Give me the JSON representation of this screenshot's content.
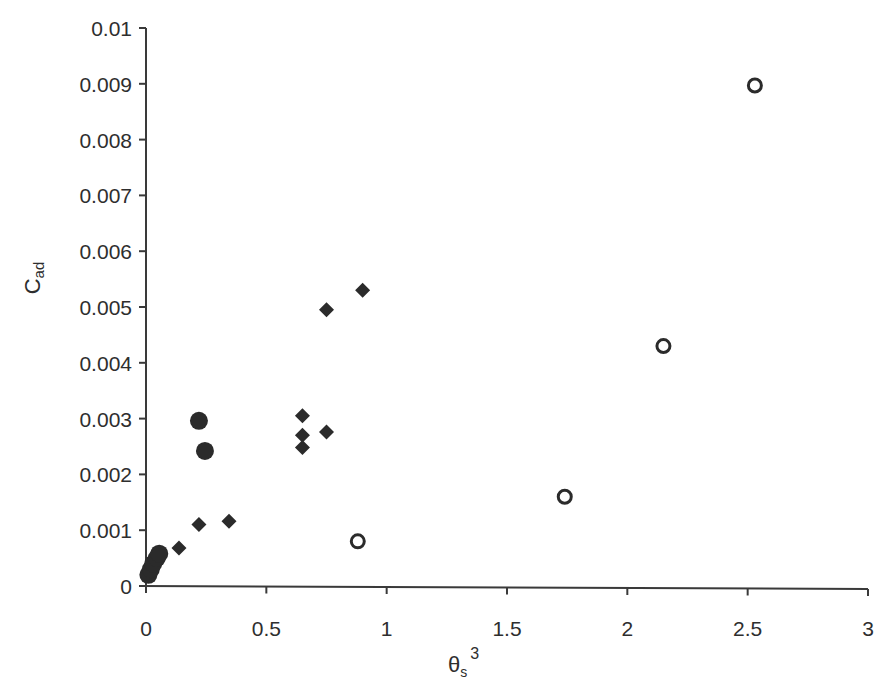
{
  "chart_data": {
    "type": "scatter",
    "title": "",
    "xlabel": "θs³",
    "xlabel_parts": {
      "base": "θ",
      "sub": "s",
      "sup": "3"
    },
    "ylabel": "Cad",
    "ylabel_parts": {
      "base": "C",
      "sub": "ad"
    },
    "xlim": [
      0,
      3
    ],
    "ylim": [
      0,
      0.01
    ],
    "xticks": [
      "0",
      "0.5",
      "1",
      "1.5",
      "2",
      "2.5",
      "3"
    ],
    "xtick_values": [
      0,
      0.5,
      1,
      1.5,
      2,
      2.5,
      3
    ],
    "yticks": [
      "0",
      "0.001",
      "0.002",
      "0.003",
      "0.004",
      "0.005",
      "0.006",
      "0.007",
      "0.008",
      "0.009",
      "0.01"
    ],
    "ytick_values": [
      0,
      0.001,
      0.002,
      0.003,
      0.004,
      0.005,
      0.006,
      0.007,
      0.008,
      0.009,
      0.01
    ],
    "grid": false,
    "legend": null,
    "series": [
      {
        "name": "filled-circles",
        "marker": "circle-filled",
        "color": "#2b2b2b",
        "points": [
          {
            "x": 0.01,
            "y": 0.0002
          },
          {
            "x": 0.02,
            "y": 0.0003
          },
          {
            "x": 0.03,
            "y": 0.0004
          },
          {
            "x": 0.045,
            "y": 0.0005
          },
          {
            "x": 0.055,
            "y": 0.00058
          },
          {
            "x": 0.22,
            "y": 0.00296
          },
          {
            "x": 0.245,
            "y": 0.00242
          }
        ]
      },
      {
        "name": "diamonds",
        "marker": "diamond-filled",
        "color": "#2b2b2b",
        "points": [
          {
            "x": 0.137,
            "y": 0.00068
          },
          {
            "x": 0.22,
            "y": 0.0011
          },
          {
            "x": 0.345,
            "y": 0.00116
          },
          {
            "x": 0.65,
            "y": 0.00305
          },
          {
            "x": 0.65,
            "y": 0.0027
          },
          {
            "x": 0.65,
            "y": 0.00248
          },
          {
            "x": 0.75,
            "y": 0.00276
          },
          {
            "x": 0.75,
            "y": 0.00495
          },
          {
            "x": 0.9,
            "y": 0.0053
          }
        ]
      },
      {
        "name": "open-circles",
        "marker": "circle-open",
        "color": "#2b2b2b",
        "points": [
          {
            "x": 0.88,
            "y": 0.0008
          },
          {
            "x": 1.74,
            "y": 0.0016
          },
          {
            "x": 2.15,
            "y": 0.0043
          },
          {
            "x": 2.53,
            "y": 0.00897
          }
        ]
      }
    ]
  },
  "layout": {
    "plot_left": 146,
    "plot_right": 868,
    "plot_top": 28,
    "plot_bottom": 586
  }
}
